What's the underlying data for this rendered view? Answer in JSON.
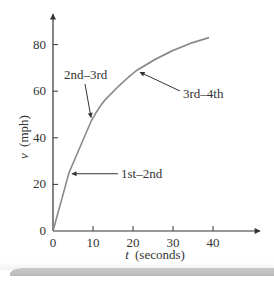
{
  "chart_data": {
    "type": "line",
    "title": "",
    "xlabel": "t (seconds)",
    "xlabel_var": "t",
    "xlabel_unit": "(seconds)",
    "ylabel": "v (mph)",
    "ylabel_var": "v",
    "ylabel_unit": "(mph)",
    "xlim": [
      0,
      50
    ],
    "ylim": [
      0,
      90
    ],
    "xticks": [
      0,
      10,
      20,
      30,
      40
    ],
    "yticks": [
      0,
      20,
      40,
      60,
      80
    ],
    "grid": false,
    "legend": null,
    "series": [
      {
        "name": "velocity",
        "x": [
          0,
          4,
          9.5,
          14,
          21,
          27,
          33,
          39
        ],
        "y": [
          0,
          25,
          47,
          58,
          69,
          75,
          80,
          83
        ]
      }
    ],
    "annotations": [
      {
        "text": "1st–2nd",
        "point": [
          4,
          25
        ]
      },
      {
        "text": "2nd–3rd",
        "point": [
          9.5,
          47
        ]
      },
      {
        "text": "3rd–4th",
        "point": [
          21,
          69
        ]
      }
    ]
  },
  "colors": {
    "axis": "#333333",
    "curve": "#8a8a8a",
    "text": "#333333",
    "shadow": "#bdbdbd"
  }
}
